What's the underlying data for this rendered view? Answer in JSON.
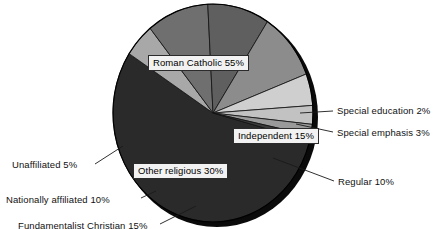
{
  "chart_data": {
    "type": "pie",
    "title": "",
    "subtitle": "",
    "xlabel": "",
    "ylabel": "",
    "legend_position": "none",
    "grid": false,
    "units": "percent",
    "total": 100,
    "categories": [
      "Roman Catholic",
      "Special education",
      "Special emphasis",
      "Independent",
      "Regular",
      "Fundamentalist Christian",
      "Nationally affiliated",
      "Unaffiliated"
    ],
    "values": [
      55,
      2,
      3,
      15,
      10,
      15,
      10,
      5
    ],
    "groups": [
      {
        "name": "Roman Catholic",
        "value": 55
      },
      {
        "name": "Other religious",
        "value": 30
      },
      {
        "name": "Independent",
        "value": 15
      }
    ],
    "slices": [
      {
        "label": "Roman Catholic 55%",
        "name": "Roman Catholic",
        "value": 55,
        "color": "#2a2a2a",
        "start_deg": 15,
        "end_deg": 213,
        "boxed": true
      },
      {
        "label": "Unaffiliated 5%",
        "name": "Unaffiliated",
        "value": 5,
        "color": "#a8a8a8",
        "start_deg": 213,
        "end_deg": 231,
        "boxed": false
      },
      {
        "label": "Nationally affiliated 10%",
        "name": "Nationally affiliated",
        "value": 10,
        "color": "#6f6f6f",
        "start_deg": 231,
        "end_deg": 267,
        "boxed": false
      },
      {
        "label": "Other religious 30%",
        "name": "Other religious",
        "value": 30,
        "color": "#5f5f5f",
        "start_deg": 267,
        "end_deg": 303,
        "boxed": true
      },
      {
        "label": "Fundamentalist Christian 15%",
        "name": "Fundamentalist Christian",
        "value": 15,
        "color": "#8c8c8c",
        "start_deg": 303,
        "end_deg": 339,
        "boxed": false
      },
      {
        "label": "Regular 10%",
        "name": "Regular",
        "value": 10,
        "color": "#cfcfcf",
        "start_deg": 339,
        "end_deg": 356,
        "boxed": false
      },
      {
        "label": "Independent 15%",
        "name": "Independent",
        "value": 15,
        "color": "#c2c2c2",
        "start_deg": 356,
        "end_deg": 366,
        "boxed": true
      },
      {
        "label": "Special emphasis 3%",
        "name": "Special emphasis",
        "value": 3,
        "color": "#9a9a9a",
        "start_deg": 366,
        "end_deg": 372,
        "boxed": false
      },
      {
        "label": "Special education 2%",
        "name": "Special education",
        "value": 2,
        "color": "#3a3a3a",
        "start_deg": 372,
        "end_deg": 375,
        "boxed": false
      }
    ],
    "colors": {
      "roman_catholic": "#2a2a2a",
      "special_education": "#3a3a3a",
      "special_emphasis": "#9a9a9a",
      "independent": "#c2c2c2",
      "regular": "#cfcfcf",
      "fundamentalist_christian": "#8c8c8c",
      "nationally_affiliated": "#6f6f6f",
      "other_religious": "#5f5f5f",
      "unaffiliated": "#a8a8a8",
      "shadow": "#0a0a0a",
      "outline": "#000000",
      "background": "#ffffff",
      "label_box_fill": "#f2f2f2",
      "label_text": "#111111"
    }
  },
  "labels": {
    "roman_catholic": "Roman Catholic 55%",
    "independent": "Independent 15%",
    "other_religious": "Other religious 30%",
    "special_education": "Special education 2%",
    "special_emphasis": "Special emphasis 3%",
    "regular": "Regular 10%",
    "unaffiliated": "Unaffiliated 5%",
    "nationally_affiliated": "Nationally affiliated 10%",
    "fundamentalist_christian": "Fundamentalist Christian 15%"
  }
}
